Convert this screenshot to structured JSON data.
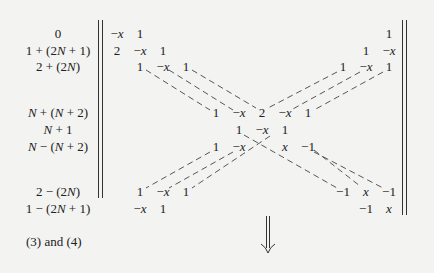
{
  "row_labels": [
    {
      "text": "0",
      "y": 34
    },
    {
      "text": "1 + (2N + 1)",
      "y": 51
    },
    {
      "text": "2 + (2N)",
      "y": 67
    },
    {
      "text": "N + (N + 2)",
      "y": 113
    },
    {
      "text": "N + 1",
      "y": 130
    },
    {
      "text": "N − (N + 2)",
      "y": 147
    },
    {
      "text": "2 − (2N)",
      "y": 192
    },
    {
      "text": "1 − (2N + 1)",
      "y": 209
    }
  ],
  "matrix": {
    "rows": [
      {
        "y": 34,
        "cells": [
          {
            "t": "−x",
            "x": 117
          },
          {
            "t": "1",
            "x": 140
          },
          {
            "t": "1",
            "x": 389
          }
        ]
      },
      {
        "y": 51,
        "cells": [
          {
            "t": "2",
            "x": 117
          },
          {
            "t": "−x",
            "x": 140
          },
          {
            "t": "1",
            "x": 163
          },
          {
            "t": "1",
            "x": 366
          },
          {
            "t": "−x",
            "x": 389
          }
        ]
      },
      {
        "y": 67,
        "cells": [
          {
            "t": "1",
            "x": 140
          },
          {
            "t": "−x",
            "x": 163
          },
          {
            "t": "1",
            "x": 186
          },
          {
            "t": "1",
            "x": 343
          },
          {
            "t": "−x",
            "x": 366
          },
          {
            "t": "1",
            "x": 389
          }
        ]
      },
      {
        "y": 113,
        "cells": [
          {
            "t": "1",
            "x": 216
          },
          {
            "t": "−x",
            "x": 239
          },
          {
            "t": "2",
            "x": 262
          },
          {
            "t": "−x",
            "x": 285
          },
          {
            "t": "1",
            "x": 308
          }
        ]
      },
      {
        "y": 130,
        "cells": [
          {
            "t": "1",
            "x": 239
          },
          {
            "t": "−x",
            "x": 262
          },
          {
            "t": "1",
            "x": 285
          }
        ]
      },
      {
        "y": 147,
        "cells": [
          {
            "t": "1",
            "x": 216
          },
          {
            "t": "−x",
            "x": 239
          },
          {
            "t": "x",
            "x": 285
          },
          {
            "t": "−1",
            "x": 308
          }
        ]
      },
      {
        "y": 192,
        "cells": [
          {
            "t": "1",
            "x": 140
          },
          {
            "t": "−x",
            "x": 163
          },
          {
            "t": "1",
            "x": 186
          },
          {
            "t": "−1",
            "x": 343
          },
          {
            "t": "x",
            "x": 366
          },
          {
            "t": "−1",
            "x": 389
          }
        ]
      },
      {
        "y": 209,
        "cells": [
          {
            "t": "−x",
            "x": 140
          },
          {
            "t": "1",
            "x": 163
          },
          {
            "t": "−1",
            "x": 366
          },
          {
            "t": "x",
            "x": 389
          }
        ]
      }
    ]
  },
  "caption": "(3) and (4)",
  "arrow": "double-down-arrow"
}
